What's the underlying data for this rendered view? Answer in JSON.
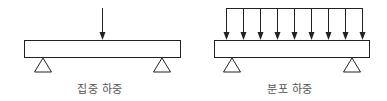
{
  "diagrams": [
    {
      "id": "concentrated",
      "label": "집중 하중",
      "beam": {
        "x": 24,
        "y": 40,
        "width": 156,
        "height": 17
      },
      "supports": [
        {
          "cx": 43
        },
        {
          "cx": 162
        }
      ],
      "arrows": [
        {
          "x": 102
        }
      ],
      "arrow_top": 8,
      "label_center_x": 100
    },
    {
      "id": "distributed",
      "label": "분포 하중",
      "beam": {
        "x": 214,
        "y": 40,
        "width": 155,
        "height": 17
      },
      "supports": [
        {
          "cx": 232
        },
        {
          "cx": 352
        }
      ],
      "arrows": [
        {
          "x": 226
        },
        {
          "x": 243
        },
        {
          "x": 260
        },
        {
          "x": 277
        },
        {
          "x": 294
        },
        {
          "x": 311
        },
        {
          "x": 328
        },
        {
          "x": 345
        },
        {
          "x": 362
        }
      ],
      "arrow_top": 8,
      "top_line": {
        "x1": 226,
        "x2": 362,
        "y": 8
      },
      "label_center_x": 290
    }
  ],
  "colors": {
    "stroke": "#222222",
    "text": "#555555"
  }
}
